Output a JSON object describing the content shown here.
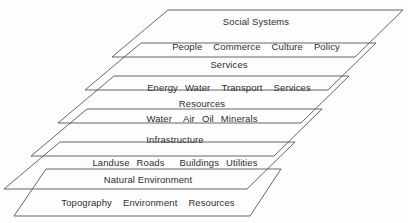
{
  "diagram": {
    "line_color": "#555555",
    "text_color": "#2e2e2e",
    "background_color": "#fdfdfd",
    "layers": [
      {
        "id": "social-systems",
        "title": "Social Systems",
        "items": [
          "People",
          "Commerce",
          "Culture",
          "Policy"
        ],
        "title_x": 256,
        "title_y": 16,
        "items_x": 256,
        "items_y": 41,
        "item_gaps": [
          "gap-md",
          "gap-md",
          "gap-md"
        ]
      },
      {
        "id": "services",
        "title": "Services",
        "items": [
          "Energy",
          "Water",
          "Transport",
          "Services"
        ],
        "title_x": 229,
        "title_y": 59,
        "items_x": 229,
        "items_y": 82,
        "item_gaps": [
          "gap-sm",
          "gap-md",
          "gap-md"
        ]
      },
      {
        "id": "resources",
        "title": "Resources",
        "items": [
          "Water",
          "Air",
          "Oil",
          "Minerals"
        ],
        "title_x": 202,
        "title_y": 98,
        "items_x": 202,
        "items_y": 113,
        "item_gaps": [
          "gap-md",
          "gap-sm",
          "gap-sm"
        ]
      },
      {
        "id": "infrastructure",
        "title": "Infrastructure",
        "items": [
          "Landuse",
          "Roads",
          "Buildings",
          "Utilities"
        ],
        "title_x": 175,
        "title_y": 134,
        "items_x": 175,
        "items_y": 157,
        "item_gaps": [
          "gap-sm",
          "gap-lg",
          "gap-sm"
        ]
      },
      {
        "id": "natural-environment",
        "title": "Natural Environment",
        "items": [
          "Topography",
          "Environment",
          "Resources"
        ],
        "title_x": 148,
        "title_y": 174,
        "items_x": 148,
        "items_y": 197,
        "item_gaps": [
          "gap-md",
          "gap-md"
        ]
      }
    ],
    "shapes": [
      {
        "id": "plane-1",
        "points": "168,10 403,10 355,57 112,57"
      },
      {
        "id": "plane-2",
        "points": "141,43 376,43 328,90 85,90"
      },
      {
        "id": "plane-3",
        "points": "114,76 349,76 301,123 58,123"
      },
      {
        "id": "plane-4",
        "points": "87,109 322,109 274,156 31,156"
      },
      {
        "id": "plane-5",
        "points": "60,142 295,142 247,189 4,189"
      },
      {
        "id": "plane-6",
        "points": "46,169 281,169 250,216 14,216"
      }
    ]
  }
}
